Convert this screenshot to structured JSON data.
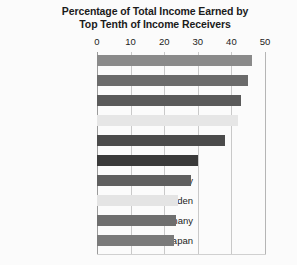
{
  "chart_data": {
    "type": "bar",
    "orientation": "horizontal",
    "title": "Percentage of Total Income Earned by Top Tenth of Income Receivers",
    "title_line1": "Percentage of Total Income Earned by",
    "title_line2": "Top Tenth of Income Receivers",
    "xlabel": "",
    "ylabel": "",
    "xlim": [
      0,
      50
    ],
    "xticks": [
      0,
      10,
      20,
      30,
      40,
      50
    ],
    "xtick_labels": [
      "0",
      "10",
      "20",
      "30",
      "40",
      "50"
    ],
    "grid": true,
    "grid_axis": "x",
    "legend": false,
    "categories": [
      "Colombia",
      "South Africa",
      "Brazil",
      "Guatemala",
      "Mexico",
      "United States",
      "Italy",
      "Sweden",
      "Germany",
      "Japan"
    ],
    "values": [
      46,
      45,
      43,
      42,
      38,
      30,
      28,
      24,
      23.5,
      23
    ],
    "bar_colors": [
      "#8a8a8a",
      "#6b6b6b",
      "#5a5a5a",
      "#e6e6e6",
      "#4b4b4b",
      "#3a3a3a",
      "#5f5f5f",
      "#e4e4e4",
      "#6e6e6e",
      "#7a7a7a"
    ],
    "bars": [
      {
        "label": "Colombia",
        "value": 46,
        "color": "#8a8a8a"
      },
      {
        "label": "South Africa",
        "value": 45,
        "color": "#6b6b6b"
      },
      {
        "label": "Brazil",
        "value": 43,
        "color": "#5a5a5a"
      },
      {
        "label": "Guatemala",
        "value": 42,
        "color": "#e6e6e6"
      },
      {
        "label": "Mexico",
        "value": 38,
        "color": "#4b4b4b"
      },
      {
        "label": "United States",
        "value": 30,
        "color": "#3a3a3a"
      },
      {
        "label": "Italy",
        "value": 28,
        "color": "#5f5f5f"
      },
      {
        "label": "Sweden",
        "value": 24,
        "color": "#e4e4e4"
      },
      {
        "label": "Germany",
        "value": 23.5,
        "color": "#6e6e6e"
      },
      {
        "label": "Japan",
        "value": 23,
        "color": "#7a7a7a"
      }
    ],
    "background_color": "#fbfbfb",
    "gridline_color": "#c9c9c9",
    "text_color": "#1b1b1b"
  }
}
